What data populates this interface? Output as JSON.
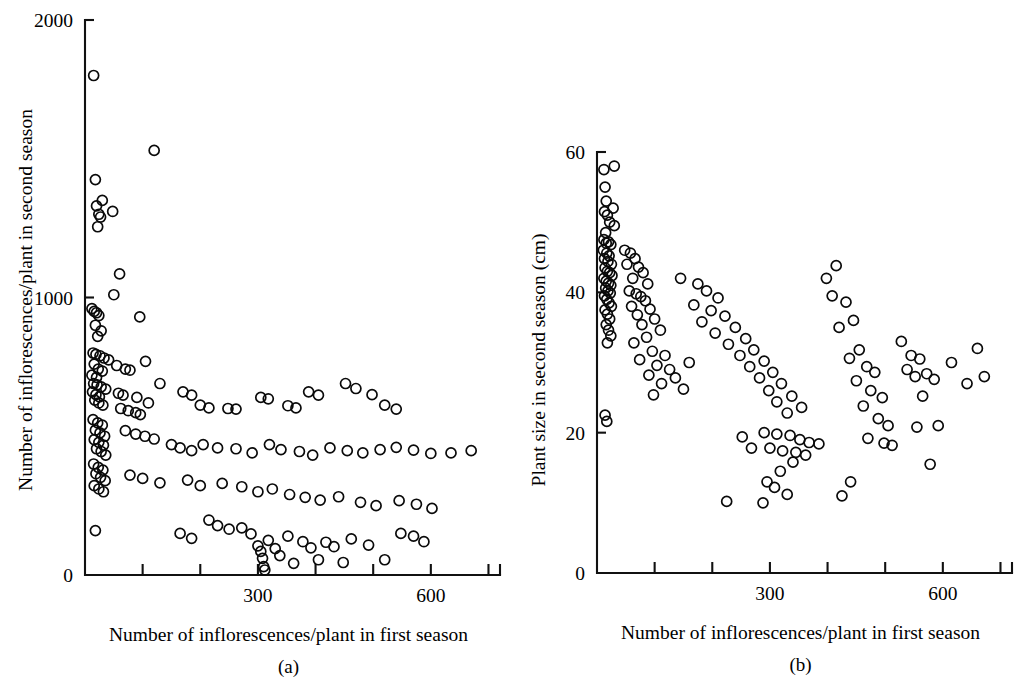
{
  "figure": {
    "background_color": "#ffffff",
    "ink_color": "#000000",
    "marker_style": "open-circle"
  },
  "chart_data": [
    {
      "type": "scatter",
      "panel_label": "(a)",
      "title": "",
      "xlabel": "Number of inflorescences/plant in first season",
      "ylabel": "Number of inflorescences/plant in second season",
      "xlim": [
        0,
        720
      ],
      "ylim": [
        0,
        2000
      ],
      "xticks": [
        0,
        100,
        200,
        300,
        400,
        500,
        600,
        700
      ],
      "xticklabels": [
        "",
        "",
        "",
        "300",
        "",
        "",
        "600",
        ""
      ],
      "yticks": [
        0,
        1000,
        2000
      ],
      "yticklabels": [
        "0",
        "1000",
        "2000"
      ],
      "grid": false,
      "legend": "none",
      "n_points": 152,
      "points": [
        [
          15,
          1800
        ],
        [
          18,
          1425
        ],
        [
          20,
          1330
        ],
        [
          24,
          1300
        ],
        [
          27,
          1290
        ],
        [
          22,
          1255
        ],
        [
          30,
          1350
        ],
        [
          120,
          1530
        ],
        [
          48,
          1310
        ],
        [
          12,
          960
        ],
        [
          16,
          950
        ],
        [
          20,
          945
        ],
        [
          24,
          935
        ],
        [
          18,
          900
        ],
        [
          28,
          880
        ],
        [
          22,
          860
        ],
        [
          60,
          1085
        ],
        [
          50,
          1010
        ],
        [
          95,
          930
        ],
        [
          14,
          800
        ],
        [
          19,
          795
        ],
        [
          26,
          790
        ],
        [
          33,
          782
        ],
        [
          41,
          775
        ],
        [
          16,
          760
        ],
        [
          23,
          742
        ],
        [
          30,
          735
        ],
        [
          12,
          720
        ],
        [
          20,
          712
        ],
        [
          55,
          755
        ],
        [
          70,
          742
        ],
        [
          78,
          738
        ],
        [
          105,
          770
        ],
        [
          15,
          690
        ],
        [
          21,
          685
        ],
        [
          28,
          678
        ],
        [
          36,
          670
        ],
        [
          13,
          660
        ],
        [
          19,
          650
        ],
        [
          25,
          642
        ],
        [
          17,
          630
        ],
        [
          24,
          620
        ],
        [
          31,
          612
        ],
        [
          58,
          655
        ],
        [
          66,
          648
        ],
        [
          90,
          640
        ],
        [
          110,
          620
        ],
        [
          130,
          690
        ],
        [
          62,
          600
        ],
        [
          75,
          592
        ],
        [
          88,
          585
        ],
        [
          96,
          578
        ],
        [
          170,
          660
        ],
        [
          185,
          648
        ],
        [
          200,
          612
        ],
        [
          215,
          602
        ],
        [
          248,
          600
        ],
        [
          262,
          598
        ],
        [
          305,
          640
        ],
        [
          318,
          635
        ],
        [
          352,
          610
        ],
        [
          366,
          602
        ],
        [
          388,
          660
        ],
        [
          405,
          648
        ],
        [
          452,
          690
        ],
        [
          470,
          672
        ],
        [
          498,
          650
        ],
        [
          520,
          612
        ],
        [
          540,
          598
        ],
        [
          14,
          560
        ],
        [
          22,
          548
        ],
        [
          30,
          540
        ],
        [
          18,
          522
        ],
        [
          26,
          512
        ],
        [
          34,
          500
        ],
        [
          16,
          488
        ],
        [
          24,
          478
        ],
        [
          32,
          468
        ],
        [
          20,
          455
        ],
        [
          28,
          445
        ],
        [
          36,
          432
        ],
        [
          70,
          520
        ],
        [
          88,
          508
        ],
        [
          104,
          500
        ],
        [
          120,
          490
        ],
        [
          150,
          470
        ],
        [
          165,
          458
        ],
        [
          185,
          448
        ],
        [
          205,
          470
        ],
        [
          230,
          458
        ],
        [
          262,
          455
        ],
        [
          290,
          440
        ],
        [
          320,
          470
        ],
        [
          340,
          452
        ],
        [
          372,
          445
        ],
        [
          395,
          432
        ],
        [
          425,
          458
        ],
        [
          455,
          448
        ],
        [
          482,
          440
        ],
        [
          512,
          452
        ],
        [
          540,
          460
        ],
        [
          570,
          450
        ],
        [
          600,
          438
        ],
        [
          635,
          440
        ],
        [
          670,
          448
        ],
        [
          15,
          400
        ],
        [
          23,
          388
        ],
        [
          31,
          378
        ],
        [
          19,
          365
        ],
        [
          27,
          352
        ],
        [
          35,
          340
        ],
        [
          16,
          322
        ],
        [
          24,
          310
        ],
        [
          32,
          300
        ],
        [
          78,
          360
        ],
        [
          100,
          348
        ],
        [
          130,
          332
        ],
        [
          178,
          342
        ],
        [
          200,
          322
        ],
        [
          238,
          330
        ],
        [
          272,
          318
        ],
        [
          300,
          300
        ],
        [
          325,
          310
        ],
        [
          355,
          290
        ],
        [
          382,
          280
        ],
        [
          408,
          270
        ],
        [
          440,
          282
        ],
        [
          478,
          262
        ],
        [
          505,
          250
        ],
        [
          545,
          268
        ],
        [
          575,
          255
        ],
        [
          602,
          240
        ],
        [
          18,
          160
        ],
        [
          165,
          150
        ],
        [
          185,
          132
        ],
        [
          215,
          198
        ],
        [
          230,
          178
        ],
        [
          250,
          165
        ],
        [
          272,
          170
        ],
        [
          288,
          148
        ],
        [
          300,
          105
        ],
        [
          305,
          85
        ],
        [
          308,
          60
        ],
        [
          310,
          30
        ],
        [
          312,
          18
        ],
        [
          318,
          125
        ],
        [
          330,
          95
        ],
        [
          338,
          70
        ],
        [
          352,
          140
        ],
        [
          362,
          42
        ],
        [
          378,
          120
        ],
        [
          392,
          98
        ],
        [
          405,
          55
        ],
        [
          418,
          118
        ],
        [
          432,
          102
        ],
        [
          448,
          45
        ],
        [
          462,
          130
        ],
        [
          492,
          108
        ],
        [
          520,
          55
        ],
        [
          548,
          150
        ],
        [
          570,
          140
        ],
        [
          588,
          120
        ]
      ]
    },
    {
      "type": "scatter",
      "panel_label": "(b)",
      "title": "",
      "xlabel": "Number of inflorescences/plant in first season",
      "ylabel": "Plant size in second season (cm)",
      "xlim": [
        0,
        720
      ],
      "ylim": [
        0,
        60
      ],
      "xticks": [
        0,
        100,
        200,
        300,
        400,
        500,
        600,
        700
      ],
      "xticklabels": [
        "",
        "",
        "",
        "300",
        "",
        "",
        "600",
        ""
      ],
      "yticks": [
        0,
        20,
        40,
        60
      ],
      "yticklabels": [
        "0",
        "20",
        "40",
        "60"
      ],
      "grid": false,
      "legend": "none",
      "n_points": 152,
      "points": [
        [
          12,
          57.5
        ],
        [
          30,
          58.0
        ],
        [
          14,
          55.0
        ],
        [
          16,
          53.0
        ],
        [
          13,
          51.5
        ],
        [
          18,
          51.0
        ],
        [
          28,
          52.0
        ],
        [
          22,
          50.0
        ],
        [
          30,
          49.5
        ],
        [
          15,
          48.5
        ],
        [
          12,
          47.5
        ],
        [
          16,
          47.0
        ],
        [
          20,
          47.2
        ],
        [
          24,
          46.8
        ],
        [
          11,
          46.0
        ],
        [
          17,
          45.6
        ],
        [
          21,
          45.2
        ],
        [
          13,
          44.8
        ],
        [
          19,
          44.4
        ],
        [
          25,
          44.0
        ],
        [
          14,
          43.5
        ],
        [
          18,
          43.0
        ],
        [
          22,
          42.8
        ],
        [
          26,
          42.4
        ],
        [
          12,
          42.0
        ],
        [
          16,
          41.6
        ],
        [
          20,
          41.3
        ],
        [
          24,
          41.0
        ],
        [
          15,
          40.6
        ],
        [
          19,
          40.2
        ],
        [
          23,
          39.9
        ],
        [
          13,
          39.5
        ],
        [
          17,
          39.0
        ],
        [
          21,
          38.5
        ],
        [
          25,
          38.0
        ],
        [
          14,
          37.5
        ],
        [
          18,
          36.9
        ],
        [
          22,
          36.2
        ],
        [
          16,
          35.4
        ],
        [
          20,
          34.6
        ],
        [
          24,
          33.8
        ],
        [
          18,
          32.8
        ],
        [
          14,
          22.5
        ],
        [
          17,
          21.6
        ],
        [
          48,
          46.0
        ],
        [
          58,
          45.6
        ],
        [
          66,
          44.8
        ],
        [
          52,
          44.0
        ],
        [
          72,
          43.6
        ],
        [
          80,
          42.8
        ],
        [
          62,
          42.0
        ],
        [
          88,
          41.2
        ],
        [
          56,
          40.2
        ],
        [
          68,
          39.8
        ],
        [
          76,
          39.4
        ],
        [
          84,
          38.8
        ],
        [
          60,
          38.0
        ],
        [
          92,
          37.6
        ],
        [
          70,
          36.8
        ],
        [
          100,
          36.2
        ],
        [
          78,
          35.4
        ],
        [
          110,
          34.6
        ],
        [
          86,
          33.6
        ],
        [
          64,
          32.8
        ],
        [
          96,
          31.6
        ],
        [
          118,
          31.0
        ],
        [
          74,
          30.4
        ],
        [
          104,
          29.6
        ],
        [
          126,
          29.0
        ],
        [
          90,
          28.2
        ],
        [
          136,
          27.8
        ],
        [
          112,
          27.0
        ],
        [
          150,
          26.2
        ],
        [
          98,
          25.4
        ],
        [
          160,
          30.0
        ],
        [
          145,
          42.0
        ],
        [
          175,
          41.2
        ],
        [
          190,
          40.2
        ],
        [
          210,
          39.2
        ],
        [
          168,
          38.2
        ],
        [
          198,
          37.4
        ],
        [
          222,
          36.6
        ],
        [
          182,
          35.8
        ],
        [
          240,
          35.0
        ],
        [
          205,
          34.2
        ],
        [
          258,
          33.4
        ],
        [
          228,
          32.6
        ],
        [
          272,
          31.8
        ],
        [
          248,
          31.0
        ],
        [
          290,
          30.2
        ],
        [
          265,
          29.4
        ],
        [
          305,
          28.6
        ],
        [
          282,
          27.8
        ],
        [
          320,
          27.0
        ],
        [
          298,
          26.0
        ],
        [
          338,
          25.2
        ],
        [
          312,
          24.4
        ],
        [
          355,
          23.6
        ],
        [
          330,
          22.8
        ],
        [
          290,
          20.0
        ],
        [
          312,
          19.8
        ],
        [
          335,
          19.6
        ],
        [
          352,
          19.0
        ],
        [
          368,
          18.6
        ],
        [
          385,
          18.4
        ],
        [
          300,
          17.8
        ],
        [
          322,
          17.4
        ],
        [
          345,
          17.2
        ],
        [
          362,
          16.8
        ],
        [
          340,
          15.8
        ],
        [
          318,
          14.5
        ],
        [
          295,
          13.0
        ],
        [
          308,
          12.2
        ],
        [
          330,
          11.2
        ],
        [
          288,
          10.0
        ],
        [
          225,
          10.2
        ],
        [
          252,
          19.4
        ],
        [
          268,
          17.8
        ],
        [
          398,
          42.0
        ],
        [
          415,
          43.8
        ],
        [
          408,
          39.5
        ],
        [
          432,
          38.6
        ],
        [
          445,
          36.0
        ],
        [
          420,
          35.0
        ],
        [
          455,
          31.8
        ],
        [
          438,
          30.6
        ],
        [
          468,
          29.4
        ],
        [
          482,
          28.6
        ],
        [
          450,
          27.4
        ],
        [
          475,
          26.0
        ],
        [
          495,
          25.0
        ],
        [
          462,
          23.8
        ],
        [
          488,
          22.0
        ],
        [
          505,
          21.0
        ],
        [
          470,
          19.2
        ],
        [
          498,
          18.5
        ],
        [
          512,
          18.2
        ],
        [
          440,
          13.0
        ],
        [
          425,
          11.0
        ],
        [
          528,
          33.0
        ],
        [
          545,
          31.0
        ],
        [
          560,
          30.5
        ],
        [
          538,
          29.0
        ],
        [
          552,
          28.0
        ],
        [
          572,
          28.4
        ],
        [
          585,
          27.6
        ],
        [
          565,
          25.2
        ],
        [
          592,
          21.0
        ],
        [
          555,
          20.8
        ],
        [
          578,
          15.5
        ],
        [
          615,
          30.0
        ],
        [
          642,
          27.0
        ],
        [
          660,
          32.0
        ],
        [
          672,
          28.0
        ]
      ]
    }
  ]
}
